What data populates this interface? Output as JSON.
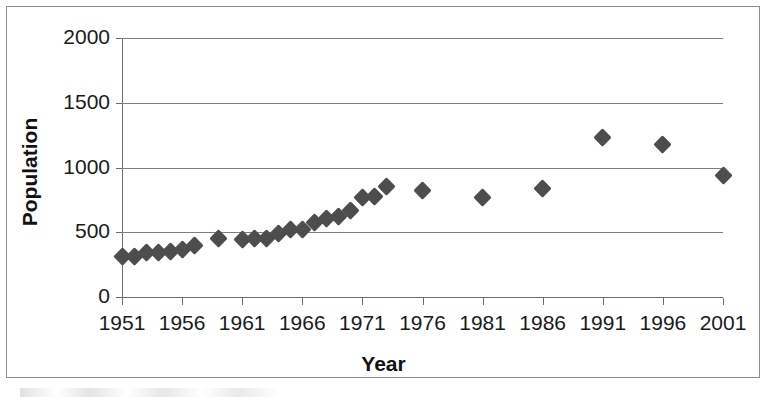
{
  "chart_data": {
    "type": "scatter",
    "title": "",
    "xlabel": "Year",
    "ylabel": "Population",
    "xlim": [
      1951,
      2001
    ],
    "ylim": [
      0,
      2000
    ],
    "grid": true,
    "legend": false,
    "marker": "diamond",
    "marker_color": "#4d4d4d",
    "x_tick_labels": [
      "1951",
      "1956",
      "1961",
      "1966",
      "1971",
      "1976",
      "1981",
      "1986",
      "1991",
      "1996",
      "2001"
    ],
    "x_ticks": [
      1951,
      1956,
      1961,
      1966,
      1971,
      1976,
      1981,
      1986,
      1991,
      1996,
      2001
    ],
    "y_tick_labels": [
      "0",
      "500",
      "1000",
      "1500",
      "2000"
    ],
    "y_ticks": [
      0,
      500,
      1000,
      1500,
      2000
    ],
    "x": [
      1951,
      1952,
      1953,
      1954,
      1955,
      1956,
      1957,
      1959,
      1961,
      1962,
      1963,
      1964,
      1965,
      1966,
      1967,
      1968,
      1969,
      1970,
      1971,
      1972,
      1973,
      1976,
      1981,
      1986,
      1991,
      1996,
      2001
    ],
    "values": [
      310,
      315,
      340,
      345,
      355,
      370,
      395,
      450,
      445,
      455,
      450,
      490,
      520,
      525,
      575,
      610,
      625,
      665,
      765,
      775,
      855,
      820,
      770,
      840,
      1230,
      1180,
      935
    ],
    "points": [
      {
        "year": 1951,
        "population": 310
      },
      {
        "year": 1952,
        "population": 315
      },
      {
        "year": 1953,
        "population": 340
      },
      {
        "year": 1954,
        "population": 345
      },
      {
        "year": 1955,
        "population": 355
      },
      {
        "year": 1956,
        "population": 370
      },
      {
        "year": 1957,
        "population": 395
      },
      {
        "year": 1959,
        "population": 450
      },
      {
        "year": 1961,
        "population": 445
      },
      {
        "year": 1962,
        "population": 455
      },
      {
        "year": 1963,
        "population": 450
      },
      {
        "year": 1964,
        "population": 490
      },
      {
        "year": 1965,
        "population": 520
      },
      {
        "year": 1966,
        "population": 525
      },
      {
        "year": 1967,
        "population": 575
      },
      {
        "year": 1968,
        "population": 610
      },
      {
        "year": 1969,
        "population": 625
      },
      {
        "year": 1970,
        "population": 665
      },
      {
        "year": 1971,
        "population": 765
      },
      {
        "year": 1972,
        "population": 775
      },
      {
        "year": 1973,
        "population": 855
      },
      {
        "year": 1976,
        "population": 820
      },
      {
        "year": 1981,
        "population": 770
      },
      {
        "year": 1986,
        "population": 840
      },
      {
        "year": 1991,
        "population": 1230
      },
      {
        "year": 1996,
        "population": 1180
      },
      {
        "year": 2001,
        "population": 935
      }
    ]
  }
}
